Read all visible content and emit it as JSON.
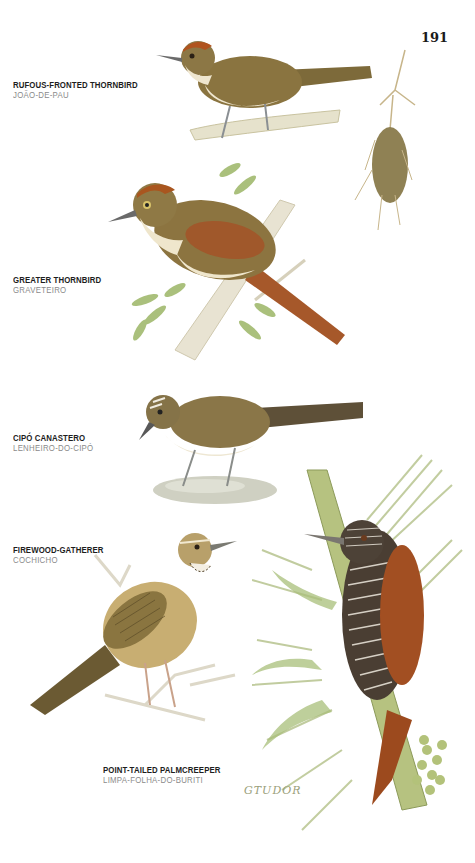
{
  "page": {
    "number": "191",
    "signature": "GTUDOR"
  },
  "species": [
    {
      "english_name": "RUFOUS-FRONTED THORNBIRD",
      "portuguese_name": "JOÃO-DE-PAU",
      "illustration": "bird-with-hanging-stick-nest"
    },
    {
      "english_name": "GREATER THORNBIRD",
      "portuguese_name": "GRAVETEIRO",
      "illustration": "bird-on-branch-with-leaves"
    },
    {
      "english_name": "CIPÓ CANASTERO",
      "portuguese_name": "LENHEIRO-DO-CIPÓ",
      "illustration": "bird-on-rock"
    },
    {
      "english_name": "FIREWOOD-GATHERER",
      "portuguese_name": "COCHICHO",
      "illustration": "streaked-bird-on-twig"
    },
    {
      "english_name": "POINT-TAILED PALMCREEPER",
      "portuguese_name": "LIMPA-FOLHA-DO-BURITI",
      "illustration": "creeper-on-palm-stem"
    }
  ],
  "colors": {
    "text_primary": "#1d1d1d",
    "text_secondary": "#8a8a8a",
    "bird_olive": "#8a7440",
    "bird_rufous": "#a0522d",
    "foliage_green": "#a9bf7a"
  }
}
